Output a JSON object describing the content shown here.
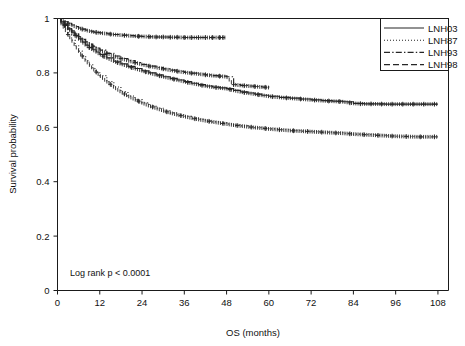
{
  "chart_data": {
    "type": "line",
    "title": "",
    "subtitle": "",
    "xlabel": "OS (months)",
    "ylabel": "Survival probability",
    "xlim": [
      0,
      111
    ],
    "ylim": [
      0,
      1
    ],
    "xticks": [
      0,
      12,
      24,
      36,
      48,
      60,
      72,
      84,
      96,
      108
    ],
    "xticklabels": [
      "0",
      "12",
      "24",
      "36",
      "48",
      "60",
      "72",
      "84",
      "96",
      "108"
    ],
    "yticks": [
      0,
      0.2,
      0.4,
      0.6,
      0.8,
      1
    ],
    "yticklabels": [
      "0",
      "0.2",
      "0.4",
      "0.6",
      "0.8",
      "1"
    ],
    "grid": false,
    "legend_position": "top-right",
    "annotations": [
      {
        "text": "Log rank p < 0.0001",
        "x": 3,
        "y": 0.055
      }
    ],
    "series": [
      {
        "name": "LNH03",
        "style": "solid",
        "color": "#262626",
        "x": [
          0,
          1,
          2,
          3,
          4,
          5,
          6,
          7,
          8,
          9,
          10,
          11,
          12,
          14,
          16,
          18,
          20,
          22,
          24,
          26,
          28,
          30,
          32,
          34,
          36,
          38,
          40,
          42,
          44,
          46,
          48,
          50,
          52,
          54,
          56,
          58,
          60,
          63,
          66,
          69,
          72,
          75,
          78,
          81,
          84,
          87,
          90,
          93,
          96,
          99,
          102,
          105,
          108
        ],
        "y": [
          1.0,
          0.988,
          0.975,
          0.962,
          0.95,
          0.938,
          0.925,
          0.913,
          0.902,
          0.893,
          0.885,
          0.877,
          0.868,
          0.855,
          0.843,
          0.833,
          0.824,
          0.816,
          0.808,
          0.8,
          0.793,
          0.786,
          0.78,
          0.774,
          0.768,
          0.762,
          0.757,
          0.752,
          0.748,
          0.745,
          0.742,
          0.736,
          0.73,
          0.726,
          0.722,
          0.718,
          0.714,
          0.71,
          0.707,
          0.704,
          0.701,
          0.698,
          0.696,
          0.694,
          0.688,
          0.686,
          0.686,
          0.685,
          0.685,
          0.685,
          0.685,
          0.685,
          0.685
        ],
        "censor_x": [
          2,
          5,
          9,
          13,
          17,
          21,
          25,
          29,
          33,
          37,
          41,
          45,
          49,
          53,
          57,
          61,
          65,
          69,
          73,
          77,
          80,
          83,
          86,
          89,
          92,
          95,
          98,
          101,
          104,
          107
        ]
      },
      {
        "name": "LNH87",
        "style": "dotted",
        "color": "#262626",
        "x": [
          0,
          1,
          2,
          3,
          4,
          5,
          6,
          7,
          8,
          9,
          10,
          11,
          12,
          14,
          16,
          18,
          20,
          22,
          24,
          26,
          28,
          30,
          32,
          34,
          36,
          38,
          40,
          42,
          44,
          46,
          48,
          50,
          52,
          54,
          56,
          58,
          60,
          63,
          66,
          69,
          72,
          75,
          78,
          81,
          84,
          87,
          90,
          93,
          96,
          99,
          102,
          105,
          108
        ],
        "y": [
          1.0,
          0.982,
          0.962,
          0.941,
          0.92,
          0.9,
          0.88,
          0.862,
          0.845,
          0.83,
          0.816,
          0.803,
          0.79,
          0.768,
          0.748,
          0.73,
          0.715,
          0.702,
          0.69,
          0.679,
          0.67,
          0.661,
          0.653,
          0.646,
          0.64,
          0.634,
          0.629,
          0.624,
          0.62,
          0.616,
          0.612,
          0.608,
          0.605,
          0.602,
          0.599,
          0.597,
          0.594,
          0.591,
          0.588,
          0.586,
          0.584,
          0.582,
          0.58,
          0.578,
          0.575,
          0.573,
          0.571,
          0.569,
          0.567,
          0.566,
          0.565,
          0.565,
          0.565
        ],
        "censor_x": [
          3,
          7,
          11,
          15,
          19,
          23,
          27,
          31,
          35,
          39,
          43,
          47,
          51,
          55,
          59,
          63,
          67,
          71,
          75,
          79,
          83,
          87,
          91,
          95,
          99,
          103,
          107
        ]
      },
      {
        "name": "LNH93",
        "style": "dashdot",
        "color": "#262626",
        "x": [
          0,
          1,
          2,
          3,
          4,
          5,
          6,
          7,
          8,
          9,
          10,
          11,
          12,
          14,
          16,
          18,
          20,
          22,
          24,
          26,
          28,
          30,
          32,
          34,
          36,
          38,
          40,
          42,
          44,
          46,
          48,
          50,
          52,
          54,
          56,
          58,
          60
        ],
        "y": [
          1.0,
          0.99,
          0.978,
          0.966,
          0.955,
          0.944,
          0.933,
          0.923,
          0.914,
          0.906,
          0.898,
          0.891,
          0.884,
          0.872,
          0.862,
          0.853,
          0.845,
          0.838,
          0.831,
          0.825,
          0.82,
          0.815,
          0.81,
          0.806,
          0.802,
          0.799,
          0.796,
          0.793,
          0.79,
          0.788,
          0.786,
          0.757,
          0.754,
          0.752,
          0.75,
          0.748,
          0.746
        ],
        "censor_x": [
          2,
          6,
          10,
          14,
          18,
          22,
          26,
          30,
          34,
          38,
          42,
          46,
          50,
          53,
          56,
          59
        ]
      },
      {
        "name": "LNH98",
        "style": "dashed",
        "color": "#262626",
        "x": [
          0,
          1,
          2,
          3,
          4,
          5,
          6,
          7,
          8,
          9,
          10,
          11,
          12,
          14,
          16,
          18,
          20,
          22,
          24,
          26,
          28,
          30,
          32,
          34,
          36,
          38,
          40,
          42,
          44,
          46,
          48
        ],
        "y": [
          1.0,
          0.994,
          0.988,
          0.982,
          0.976,
          0.97,
          0.965,
          0.961,
          0.957,
          0.954,
          0.951,
          0.949,
          0.947,
          0.944,
          0.941,
          0.939,
          0.937,
          0.935,
          0.934,
          0.933,
          0.932,
          0.932,
          0.931,
          0.931,
          0.93,
          0.93,
          0.93,
          0.93,
          0.93,
          0.93,
          0.93
        ],
        "censor_x": [
          3,
          7,
          11,
          15,
          19,
          23,
          26,
          28,
          30,
          32,
          34,
          36,
          38,
          40,
          42,
          44,
          46,
          47
        ]
      }
    ]
  },
  "legend": {
    "entries": [
      {
        "label": "LNH03",
        "style": "solid"
      },
      {
        "label": "LNH87",
        "style": "dotted"
      },
      {
        "label": "LNH93",
        "style": "dashdot"
      },
      {
        "label": "LNH98",
        "style": "dashed"
      }
    ]
  },
  "colors": {
    "curve": "#262626",
    "axis": "#1a1a1a",
    "text": "#111111",
    "background": "#ffffff"
  }
}
